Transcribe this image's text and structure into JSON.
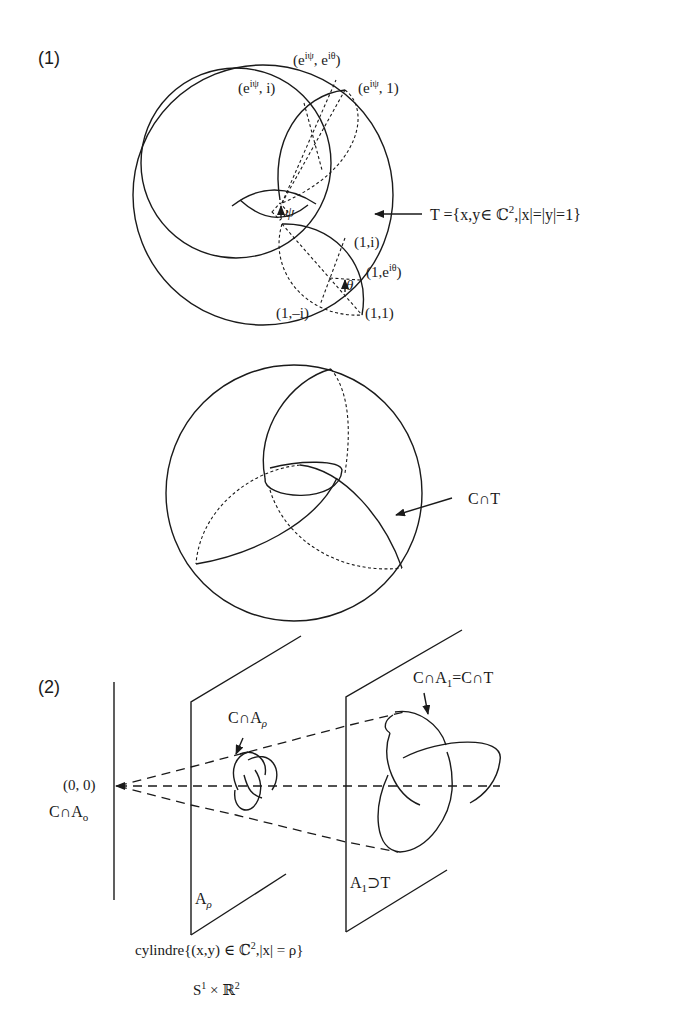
{
  "part1": {
    "label": "(1)",
    "torus_labels": {
      "e_ipsi_e_itheta": {
        "base": "(e",
        "sup1": "iψ",
        "mid": ", e",
        "sup2": "iθ",
        "end": ")"
      },
      "e_ipsi_i": {
        "base": "(e",
        "sup1": "iψ",
        "end": ", i)"
      },
      "e_ipsi_1": {
        "base": "(e",
        "sup1": "iψ",
        "end": ", 1)"
      },
      "psi": "ψ",
      "theta": "θ",
      "one_i": "(1,i)",
      "one_e_itheta": {
        "base": "(1,e",
        "sup": "iθ",
        "end": ")"
      },
      "one_minus_i": "(1,–i)",
      "one_one": "(1,1)"
    },
    "torus_definition": {
      "prefix": "T ={x,y∈ ℂ",
      "sup": "2",
      "suffix": ",|x|=|y|=1}"
    },
    "sphere_label": "C∩T"
  },
  "part2": {
    "label": "(2)",
    "origin_label": "(0, 0)",
    "c_cap_a0": {
      "base": "C∩A",
      "sub": "o"
    },
    "c_cap_arho": {
      "base": "C∩A",
      "sub": "ρ"
    },
    "c_cap_a1": {
      "base": "C∩A",
      "sub": "1",
      "suffix": "=C∩T"
    },
    "a_rho": {
      "base": "A",
      "sub": "ρ"
    },
    "a1_supset_t": {
      "base": "A",
      "sub": "1",
      "suffix": "⊃T"
    },
    "cylinder_def": {
      "prefix": "cylindre{(x,y) ∈  ℂ",
      "sup": "2",
      "suffix": ",|x| = ρ}"
    },
    "product": {
      "s": "S",
      "s_sup": "1",
      "times": " × ℝ",
      "r_sup": "2"
    }
  }
}
